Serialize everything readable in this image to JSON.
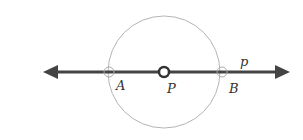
{
  "diagram": {
    "line_label": "p",
    "points": [
      {
        "id": "A",
        "label": "A"
      },
      {
        "id": "P",
        "label": "P"
      },
      {
        "id": "B",
        "label": "B"
      }
    ],
    "colors": {
      "line": "#444444",
      "circle": "#b0b0b0",
      "center_point": "#333333"
    }
  }
}
